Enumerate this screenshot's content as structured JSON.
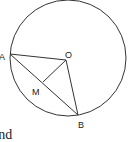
{
  "diagram": {
    "colors": {
      "stroke": "#333333",
      "text": "#1a1a1a",
      "background": "#ffffff"
    },
    "circle": {
      "cx": 68,
      "cy": 58,
      "r": 58
    },
    "points": {
      "A": {
        "label": "A",
        "x": 10,
        "y": 54
      },
      "O": {
        "label": "O",
        "x": 66,
        "y": 60
      },
      "M": {
        "label": "M",
        "x": 43,
        "y": 82
      },
      "B": {
        "label": "B",
        "x": 78,
        "y": 115
      }
    },
    "segments": [
      "AO",
      "AB",
      "OM",
      "OB"
    ]
  },
  "caption_fragment": "and"
}
